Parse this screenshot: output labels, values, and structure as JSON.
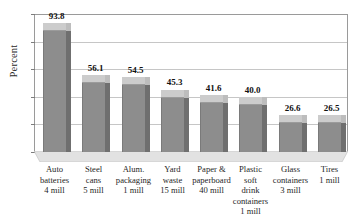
{
  "chart_data": {
    "type": "bar",
    "title": "",
    "xlabel": "",
    "ylabel": "Percent",
    "ylim": [
      0,
      100
    ],
    "yticks": [
      0,
      20,
      40,
      60,
      80,
      100
    ],
    "ytick_labels": [
      "0",
      "20",
      "40",
      "60",
      "80",
      "100"
    ],
    "grid": true,
    "legend": "none",
    "style": "3d-column",
    "categories": [
      "Auto batteries 4 mill",
      "Steel cans 5 mill",
      "Alum. packaging 1 mill",
      "Yard waste 15 mill",
      "Paper & paperboard 40 mill",
      "Plastic soft drink containers 1 mill",
      "Glass containers 3 mill",
      "Tires 1 mill"
    ],
    "category_lines": [
      [
        "Auto",
        "batteries",
        "4 mill"
      ],
      [
        "Steel",
        "cans",
        "5 mill"
      ],
      [
        "Alum.",
        "packaging",
        "1 mill"
      ],
      [
        "Yard",
        "waste",
        "15 mill"
      ],
      [
        "Paper &",
        "paperboard",
        "40 mill"
      ],
      [
        "Plastic",
        "soft",
        "drink",
        "containers",
        "1 mill"
      ],
      [
        "Glass",
        "containers",
        "3 mill"
      ],
      [
        "Tires",
        "1 mill"
      ]
    ],
    "values": [
      93.8,
      56.1,
      54.5,
      45.3,
      41.6,
      40.0,
      26.6,
      26.5
    ],
    "value_labels": [
      "93.8",
      "56.1",
      "54.5",
      "45.3",
      "41.6",
      "40.0",
      "26.6",
      "26.5"
    ],
    "colors": {
      "bar_front": "#8d8d8d",
      "bar_top": "#cccccc",
      "bar_side": "#6f6f6f",
      "floor": "#e0e0e0",
      "gridline": "#c6c6c6",
      "frame": "#9a9a9a",
      "text": "#1a1a1a",
      "background": "#ffffff"
    }
  }
}
